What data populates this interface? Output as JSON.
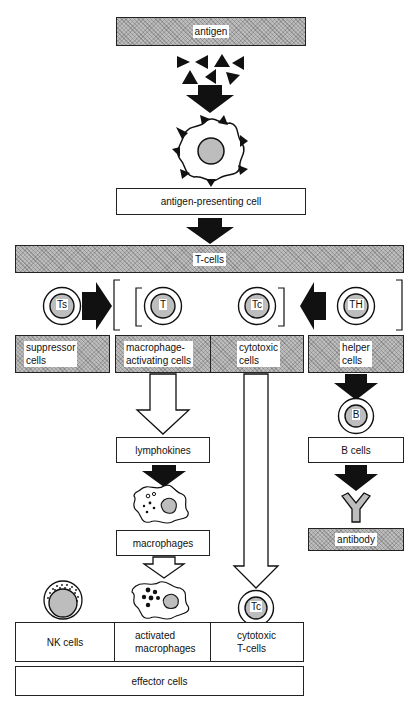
{
  "diagram": {
    "nodes": {
      "antigen": "antigen",
      "apc": "antigen-presenting cell",
      "tcells": "T-cells",
      "suppressor": [
        "suppressor",
        "cells"
      ],
      "macro_activating": [
        "macrophage-",
        "activating cells"
      ],
      "cytotoxic": [
        "cytotoxic",
        "cells"
      ],
      "helper": [
        "helper",
        "cells"
      ],
      "lymphokines": "lymphokines",
      "b_cells": "B cells",
      "macrophages": "macrophages",
      "antibody": "antibody",
      "nk_cells": "NK cells",
      "activated_macrophages": [
        "activated",
        "macrophages"
      ],
      "cytotoxic_tcells": [
        "cytotoxic",
        "T-cells"
      ],
      "effector": "effector cells"
    },
    "cell_labels": {
      "ts": "Ts",
      "t": "T",
      "tc": "Tc",
      "th": "TH",
      "b": "B",
      "tc_bottom": "Tc"
    },
    "edges": [
      {
        "from": "antigen",
        "to": "apc",
        "style": "solid-arrow"
      },
      {
        "from": "apc",
        "to": "tcells",
        "style": "solid-arrow"
      },
      {
        "from": "suppressor",
        "to": "macro_activating+cytotoxic",
        "style": "solid-arrow"
      },
      {
        "from": "helper",
        "to": "macro_activating+cytotoxic",
        "style": "solid-arrow"
      },
      {
        "from": "macro_activating",
        "to": "lymphokines",
        "style": "hollow-arrow"
      },
      {
        "from": "lymphokines",
        "to": "macrophages",
        "style": "solid-arrow"
      },
      {
        "from": "macrophages",
        "to": "activated_macrophages",
        "style": "hollow-arrow"
      },
      {
        "from": "cytotoxic",
        "to": "cytotoxic_tcells",
        "style": "hollow-arrow"
      },
      {
        "from": "helper",
        "to": "b_cells",
        "style": "solid-arrow"
      },
      {
        "from": "b_cells",
        "to": "antibody",
        "style": "solid-arrow"
      }
    ],
    "colors": {
      "shade": "#bdbdbd",
      "ink": "#111111",
      "background": "#ffffff"
    }
  }
}
